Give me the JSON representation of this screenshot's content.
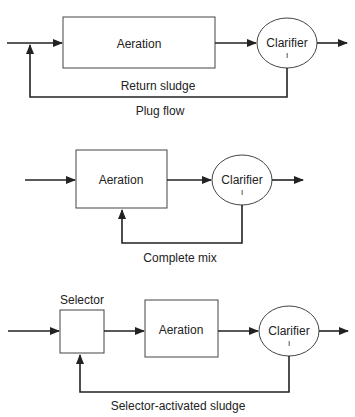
{
  "diagrams": [
    {
      "caption": "Plug flow",
      "nodes": {
        "aeration": "Aeration",
        "clarifier": "Clarifier",
        "clarifier_mark": "I"
      },
      "return_label": "Return sludge"
    },
    {
      "caption": "Complete mix",
      "nodes": {
        "aeration": "Aeration",
        "clarifier": "Clarifier",
        "clarifier_mark": "I"
      }
    },
    {
      "caption": "Selector-activated sludge",
      "nodes": {
        "selector": "Selector",
        "aeration": "Aeration",
        "clarifier": "Clarifier",
        "clarifier_mark": "I"
      }
    }
  ],
  "colors": {
    "line": "#222222",
    "box_stroke": "#444444"
  }
}
